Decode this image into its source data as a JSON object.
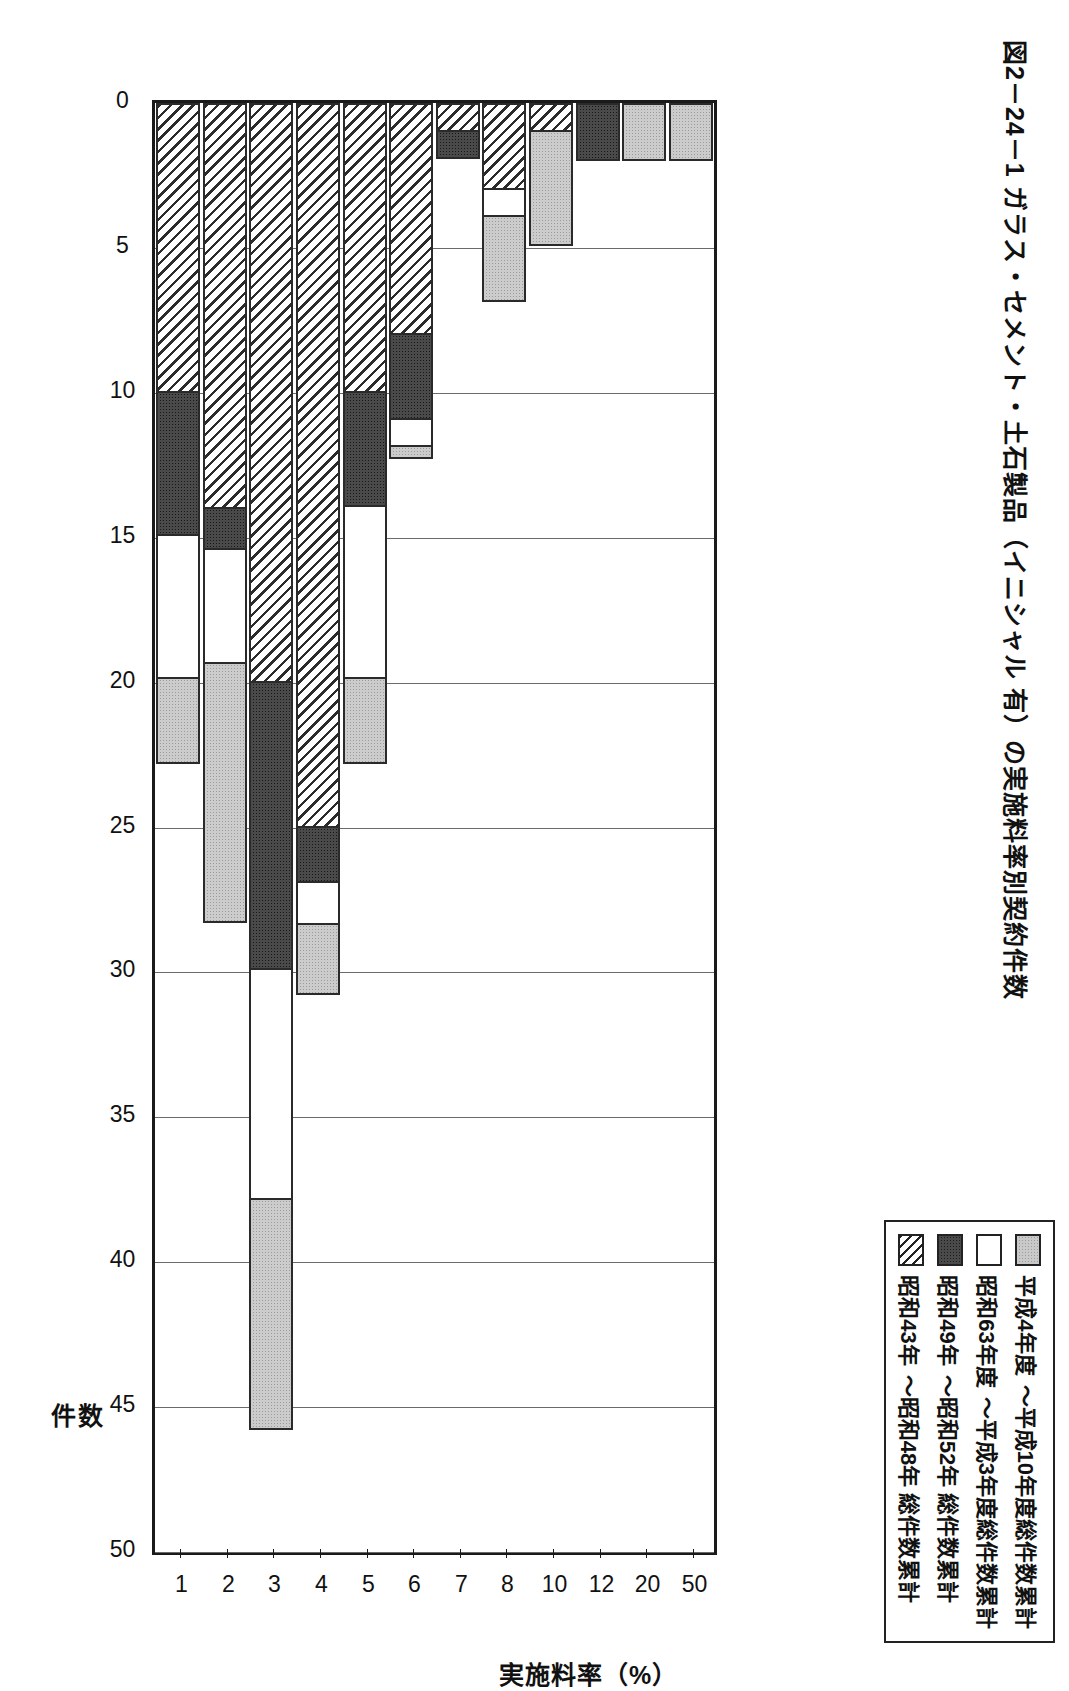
{
  "figure": {
    "title": "図2－24－1  ガラス・セメント・土石製品（イニシャル 有）の実施料率別契約件数"
  },
  "legend": {
    "items": [
      {
        "label": "平成4年度\n～平成10年度総件数累計",
        "swatch": "gray-dotted",
        "key": "h4_h10"
      },
      {
        "label": "昭和63年度\n～平成3年度総件数累計",
        "swatch": "white",
        "key": "s63_h3"
      },
      {
        "label": "昭和49年\n～昭和52年 総件数累計",
        "swatch": "dark-dotted",
        "key": "s49_s52"
      },
      {
        "label": "昭和43年\n～昭和48年 総件数累計",
        "swatch": "diagonal-hatch",
        "key": "s43_s48"
      }
    ],
    "labels_line1": [
      "平成4年度",
      "昭和63年度",
      "昭和49年",
      "昭和43年"
    ],
    "labels_line2": [
      "～平成10年度総件数累計",
      "～平成3年度総件数累計",
      "～昭和52年 総件数累計",
      "～昭和48年 総件数累計"
    ]
  },
  "chart_data": {
    "type": "bar",
    "orientation": "horizontal-stacked",
    "title": "図2－24－1  ガラス・セメント・土石製品（イニシャル 有）の実施料率別契約件数",
    "xlabel": "実施料率（%）",
    "ylabel": "件数",
    "categories": [
      "1",
      "2",
      "3",
      "4",
      "5",
      "6",
      "7",
      "8",
      "10",
      "12",
      "20",
      "50"
    ],
    "ylim": [
      0,
      50
    ],
    "yticks": [
      0,
      5,
      10,
      15,
      20,
      25,
      30,
      35,
      40,
      45,
      50
    ],
    "grid": true,
    "legend_position": "top-right",
    "series": [
      {
        "name": "昭和43年～昭和48年 総件数累計",
        "swatch": "diagonal-hatch",
        "values": [
          10,
          14,
          20,
          25,
          10,
          8,
          1,
          3,
          1,
          0,
          0,
          0
        ]
      },
      {
        "name": "昭和49年～昭和52年 総件数累計",
        "swatch": "dark-dotted",
        "values": [
          5,
          1.5,
          10,
          2,
          4,
          3,
          1,
          0,
          0,
          2,
          0,
          0
        ]
      },
      {
        "name": "昭和63年度～平成3年度総件数累計",
        "swatch": "white",
        "values": [
          5,
          4,
          8,
          1.5,
          6,
          1,
          0,
          1,
          0,
          0,
          0,
          0
        ]
      },
      {
        "name": "平成4年度～平成10年度総件数累計",
        "swatch": "gray-dotted",
        "values": [
          3,
          9,
          8,
          2.5,
          3,
          0.5,
          0,
          3,
          4,
          0,
          2,
          2
        ]
      }
    ],
    "totals": [
      23,
      28.5,
      46,
      31,
      23,
      12.5,
      2,
      7,
      5,
      2,
      2,
      2
    ]
  }
}
